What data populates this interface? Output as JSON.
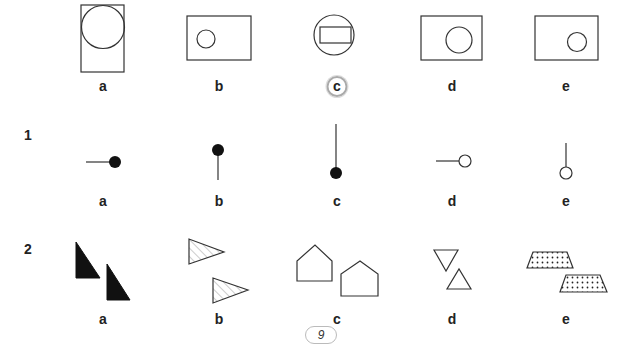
{
  "example_row": {
    "labels": [
      "a",
      "b",
      "c",
      "d",
      "e"
    ],
    "answer": "c",
    "description": "Shapes: rectangle with circle inside; c is circle with rectangle inside (odd one out, circled)"
  },
  "question_1": {
    "number": "1",
    "labels": [
      "a",
      "b",
      "c",
      "d",
      "e"
    ],
    "description": "Line with dot pins; a-c filled dots, d-e hollow dots"
  },
  "question_2": {
    "number": "2",
    "labels": [
      "a",
      "b",
      "c",
      "d",
      "e"
    ],
    "description": "Pairs of shapes: black right triangles, hatched triangles, pentagons (houses), triangles up/down, dotted trapezoids"
  },
  "page": {
    "number": "9"
  },
  "colors": {
    "ink": "#222222",
    "fill": "#111111",
    "circle_highlight": "#aaaaaa"
  }
}
